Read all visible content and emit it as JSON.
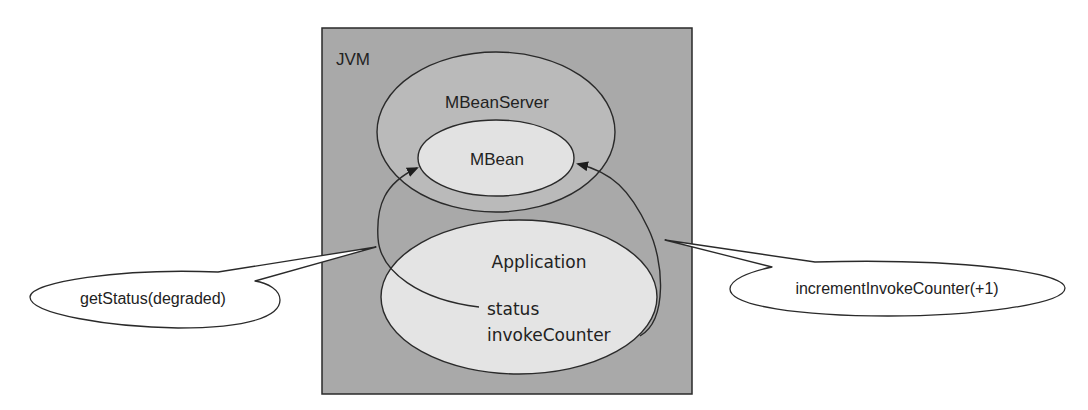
{
  "diagram": {
    "container": {
      "label": "JVM",
      "fill": "#a9a9a9"
    },
    "mbean_server": {
      "label": "MBeanServer",
      "fill": "#c9c9c9"
    },
    "mbean": {
      "label": "MBean",
      "fill": "#e2e2e2"
    },
    "application": {
      "label": "Application",
      "fill": "#e4e4e4",
      "fields": [
        "status",
        "invokeCounter"
      ]
    },
    "callouts": {
      "left": {
        "label": "getStatus(degraded)"
      },
      "right": {
        "label": "incrementInvokeCounter(+1)"
      }
    },
    "colors": {
      "stroke": "#2a2a2a",
      "text": "#222222"
    }
  }
}
